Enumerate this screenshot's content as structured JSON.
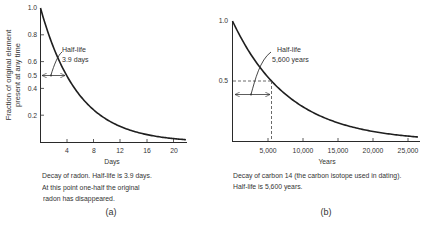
{
  "chart_data": [
    {
      "type": "line",
      "panel_label": "(a)",
      "title": "Decay of radon",
      "xlabel": "Days",
      "ylabel": "Fraction of original element present at any time",
      "xlim": [
        0,
        22
      ],
      "ylim": [
        0,
        1.0
      ],
      "x_ticks": [
        4,
        8,
        12,
        16,
        20
      ],
      "y_ticks": [
        1.0,
        0.8,
        0.6,
        0.5,
        0.4,
        0.2
      ],
      "grid": false,
      "half_life": 3.9,
      "annotation": [
        "Half-life",
        "3.9 days"
      ],
      "series": [
        {
          "name": "Radon",
          "x": [
            0,
            2,
            3.9,
            6,
            8,
            10,
            12,
            14,
            16,
            18,
            20,
            22
          ],
          "values": [
            1.0,
            0.7,
            0.5,
            0.34,
            0.24,
            0.17,
            0.12,
            0.08,
            0.058,
            0.041,
            0.029,
            0.02
          ]
        }
      ],
      "caption": [
        "Decay of radon. Half-life is 3.9 days.",
        "At this point one-half the original",
        "radon has disappeared."
      ]
    },
    {
      "type": "line",
      "panel_label": "(b)",
      "title": "Decay of carbon 14",
      "xlabel": "Years",
      "ylabel": "",
      "xlim": [
        0,
        26000
      ],
      "ylim": [
        0,
        1.0
      ],
      "x_ticks": [
        5000,
        10000,
        15000,
        20000,
        25000
      ],
      "x_tick_labels": [
        "5,000",
        "10,000",
        "15,000",
        "20,000",
        "25,000"
      ],
      "y_ticks": [
        1.0,
        0.5
      ],
      "grid": false,
      "half_life": 5600,
      "annotation": [
        "Half-life",
        "5,600 years"
      ],
      "series": [
        {
          "name": "Carbon 14",
          "x": [
            0,
            2500,
            5600,
            8000,
            10000,
            12500,
            15000,
            17500,
            20000,
            22500,
            25000,
            26000
          ],
          "values": [
            1.0,
            0.73,
            0.5,
            0.37,
            0.29,
            0.21,
            0.16,
            0.11,
            0.084,
            0.062,
            0.045,
            0.04
          ]
        }
      ],
      "caption": [
        "Decay of carbon 14 (the carbon isotope used in dating).",
        "Half-life is 5,600 years."
      ]
    }
  ],
  "panel_a": {
    "ylabel_line1": "Fraction of original element",
    "ylabel_line2": "present at any time",
    "y_ticks": [
      "1.0",
      "0.8",
      "0.6",
      "0.5",
      "0.4",
      "0.2"
    ],
    "x_ticks": [
      "4",
      "8",
      "12",
      "16",
      "20"
    ],
    "xlabel": "Days",
    "annot_line1": "Half-life",
    "annot_line2": "3.9 days",
    "caption_line1": "Decay of radon. Half-life is 3.9 days.",
    "caption_line2": "At this point one-half the original",
    "caption_line3": "radon has disappeared.",
    "label": "(a)"
  },
  "panel_b": {
    "y_ticks": [
      "1.0",
      "0.5"
    ],
    "x_ticks": [
      "5,000",
      "10,000",
      "15,000",
      "20,000",
      "25,000"
    ],
    "xlabel": "Years",
    "annot_line1": "Half-life",
    "annot_line2": "5,600 years",
    "caption_line1": "Decay of carbon 14 (the carbon isotope used in dating).",
    "caption_line2": "Half-life is 5,600 years.",
    "label": "(b)"
  },
  "colors": {
    "ink": "#2a2a2a",
    "background": "#ffffff"
  }
}
